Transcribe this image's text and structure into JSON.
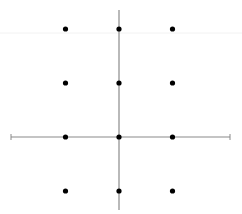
{
  "diagram": {
    "title": "",
    "colors": {
      "background": "#ffffff",
      "axis": "#8a8a8a",
      "point": "#000000",
      "faint_line": "#f2f2f2"
    },
    "origin_px": {
      "x": 119,
      "y": 137
    },
    "unit_px": {
      "x": 53.5,
      "y": 54
    },
    "x_axis": {
      "from_px": 11,
      "to_px": 230,
      "y_px": 137
    },
    "y_axis": {
      "from_px": 10,
      "to_px": 210,
      "x_px": 119
    },
    "points": [
      {
        "x": -1,
        "y": 2
      },
      {
        "x": 0,
        "y": 2
      },
      {
        "x": 1,
        "y": 2
      },
      {
        "x": -1,
        "y": 1
      },
      {
        "x": 0,
        "y": 1
      },
      {
        "x": 1,
        "y": 1
      },
      {
        "x": -1,
        "y": 0
      },
      {
        "x": 0,
        "y": 0
      },
      {
        "x": 1,
        "y": 0
      },
      {
        "x": -1,
        "y": -1
      },
      {
        "x": 0,
        "y": -1
      },
      {
        "x": 1,
        "y": -1
      }
    ],
    "point_radius_px": 2.6
  }
}
